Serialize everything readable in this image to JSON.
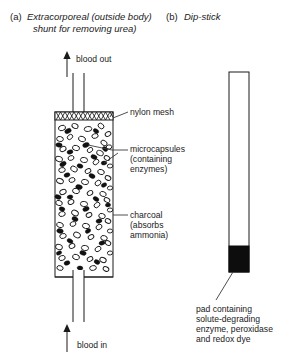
{
  "figure": {
    "background_color": "#ffffff",
    "ink_color": "#1a1a1a",
    "width": 291,
    "height": 363
  },
  "panel_a": {
    "letter": "(a)",
    "title_line1": "Extracorporeal (outside body)",
    "title_line2": "shunt for removing urea)",
    "flow_out_label": "blood out",
    "flow_in_label": "blood in",
    "annotations": {
      "nylon_mesh": "nylon mesh",
      "microcapsules_line1": "microcapsules",
      "microcapsules_line2": "(containing",
      "microcapsules_line3": "enzymes)",
      "charcoal_line1": "charcoal",
      "charcoal_line2": "(absorbs",
      "charcoal_line3": "ammonia)"
    },
    "column": {
      "x": 55,
      "y": 112,
      "width": 58,
      "height": 165,
      "mesh_band_height": 8,
      "mesh_cross_count": 13
    },
    "particles": {
      "charcoal_color": "#ffffff",
      "charcoal_outline": "#1a1a1a",
      "microcapsule_color": "#111111"
    }
  },
  "panel_b": {
    "letter": "(b)",
    "title": "Dip-stick",
    "caption_line1": "pad containing",
    "caption_line2": "solute-degrading",
    "caption_line3": "enzyme, peroxidase",
    "caption_line4": "and redox dye",
    "stick": {
      "x": 229,
      "y": 72,
      "width": 20,
      "height": 200,
      "pad_height": 26,
      "pad_color": "#0d0d0d"
    }
  }
}
